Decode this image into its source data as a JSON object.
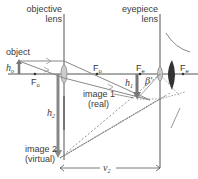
{
  "diagram": {
    "labels": {
      "objective_lens_line1": "objective",
      "objective_lens_line2": "lens",
      "eyepiece_lens_line1": "eyepiece",
      "eyepiece_lens_line2": "lens",
      "object": "object",
      "h_o_main": "h",
      "h_o_sub": "o",
      "F_o_left_main": "F",
      "F_o_left_sub": "o",
      "F_o_right_main": "F",
      "F_o_right_sub": "o",
      "F_e_left_main": "F",
      "F_e_left_sub": "e",
      "F_e_right_main": "F",
      "F_e_right_sub": "e",
      "h1_main": "h",
      "h1_sub": "1",
      "h2_main": "h",
      "h2_sub": "2",
      "beta_prime": "β'",
      "image1_line1": "image 1",
      "image1_line2": "(real)",
      "image2_line1": "image 2",
      "image2_line2": "(virtual)",
      "v2_main": "v",
      "v2_sub": "2"
    },
    "colors": {
      "line": "#555555",
      "arrow": "#777777",
      "lens_fill": "#cccccc",
      "eye_fill": "#333333",
      "text": "#3a3a3a"
    }
  }
}
